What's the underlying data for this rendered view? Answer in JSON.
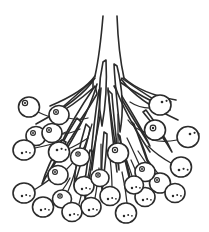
{
  "illustration": {
    "title": "Berry cluster line drawing",
    "subject": "infructescence",
    "style": "black-and-white ink line art",
    "caption": "Line drawing of a drooping berry cluster: a central stalk divides into spreading branchlets bearing many round berries, interspersed with narrow pointed bracts.",
    "background_color": "#ffffff",
    "ink_color": "#2b2b2b",
    "canvas": {
      "width": 209,
      "height": 232
    },
    "counts": {
      "berries": 31,
      "bracts": 16,
      "main_stalk_lines": 2
    },
    "parts": {
      "stalk_label": "main stalk",
      "branch_label": "branchlet",
      "berry_label": "berry",
      "pedicel_label": "pedicel",
      "bract_label": "bract"
    },
    "stalk": {
      "left_line": "M103,16 C101,40 99,58 95,76",
      "right_line": "M117,16 C118,42 120,60 124,78"
    },
    "branches": [
      "M95,76 C88,86 74,96 50,106",
      "M95,78 C86,92 66,108 36,124",
      "M97,84 C92,102 82,124 66,150",
      "M101,88 C99,112 96,140 92,170",
      "M108,88 C110,114 113,142 117,172",
      "M115,86 C122,106 134,128 150,152",
      "M122,80 C132,94 152,108 178,120",
      "M124,78 C135,88 154,96 176,100"
    ],
    "bracts": [
      {
        "d": "M93,80 C80,92 64,106 50,118 C62,112 80,100 93,88 Z"
      },
      {
        "d": "M95,86 C84,102 70,124 60,146 C72,132 88,110 97,94 Z"
      },
      {
        "d": "M99,90 C95,114 92,142 90,168 C95,144 101,114 103,96 Z"
      },
      {
        "d": "M108,90 C111,116 115,144 119,170 C117,142 113,112 112,94 Z"
      },
      {
        "d": "M114,86 C124,104 138,126 150,146 C140,124 124,100 117,88 Z"
      },
      {
        "d": "M120,82 C134,92 152,102 170,110 C152,98 132,86 122,78 Z"
      },
      {
        "d": "M103,62 C99,80 98,104 102,126 C106,104 107,80 106,60 Z"
      },
      {
        "d": "M117,66 C122,86 124,110 120,132 C118,110 115,86 114,64 Z"
      },
      {
        "d": "M77,118 C68,132 58,150 52,168 C62,152 74,134 81,122 Z"
      },
      {
        "d": "M86,124 C80,144 75,166 74,186 C80,166 88,142 90,128 Z"
      },
      {
        "d": "M132,122 C140,138 148,158 152,176 C146,156 138,136 134,124 Z"
      },
      {
        "d": "M143,112 C153,124 164,138 172,152 C164,134 152,118 146,110 Z"
      },
      {
        "d": "M62,140 C54,154 46,170 42,184 C50,170 60,152 66,142 Z"
      },
      {
        "d": "M118,134 C124,152 130,172 132,190 C128,172 122,150 120,136 Z"
      },
      {
        "d": "M104,132 C102,152 101,174 102,192 C104,174 107,152 107,134 Z"
      },
      {
        "d": "M90,150 C86,168 84,186 85,200 C88,186 92,166 93,152 Z"
      }
    ],
    "berries": [
      {
        "cx": 29,
        "cy": 107,
        "rx": 10.5,
        "ry": 10,
        "mark": "ring",
        "mx": 25,
        "my": 103,
        "mr": 2.6,
        "pedicel": "M38,112 C46,116 52,118 58,118"
      },
      {
        "cx": 36,
        "cy": 136,
        "rx": 10,
        "ry": 9.5,
        "mark": "ring",
        "mx": 33,
        "my": 133,
        "mr": 2.4,
        "pedicel": "M46,137 C54,137 60,135 66,132"
      },
      {
        "cx": 24,
        "cy": 150,
        "rx": 11,
        "ry": 10,
        "mark": "speck",
        "mx": 22,
        "my": 153,
        "mr": 2.2,
        "pedicel": "M35,148 C46,146 54,144 62,140"
      },
      {
        "cx": 52,
        "cy": 133,
        "rx": 10,
        "ry": 9.5,
        "mark": "ring",
        "mx": 49,
        "my": 130,
        "mr": 2.4,
        "pedicel": "M61,134 C68,134 74,132 80,129"
      },
      {
        "cx": 59,
        "cy": 152,
        "rx": 10.5,
        "ry": 10,
        "mark": "speck",
        "mx": 57,
        "my": 150,
        "mr": 2.4,
        "pedicel": "M68,149 C76,146 82,142 88,138"
      },
      {
        "cx": 58,
        "cy": 175,
        "rx": 10,
        "ry": 9.5,
        "mark": "ring",
        "mx": 55,
        "my": 172,
        "mr": 2.4,
        "pedicel": "M66,170 C74,162 80,154 85,146"
      },
      {
        "cx": 24,
        "cy": 193,
        "rx": 11,
        "ry": 10,
        "mark": "speck",
        "mx": 22,
        "my": 196,
        "mr": 2.2,
        "pedicel": "M34,190 C44,184 52,178 58,172"
      },
      {
        "cx": 43,
        "cy": 207,
        "rx": 10.5,
        "ry": 10,
        "mark": "speck",
        "mx": 41,
        "my": 210,
        "mr": 2.2,
        "pedicel": "M52,202 C60,194 66,186 70,178"
      },
      {
        "cx": 62,
        "cy": 199,
        "rx": 9.5,
        "ry": 9,
        "mark": "ring",
        "mx": 60,
        "my": 196,
        "mr": 2.2,
        "pedicel": "M68,191 C72,182 75,172 77,164"
      },
      {
        "cx": 72,
        "cy": 212,
        "rx": 10,
        "ry": 9.5,
        "mark": "speck",
        "mx": 70,
        "my": 215,
        "mr": 2.2,
        "pedicel": "M79,204 C82,194 84,184 85,176"
      },
      {
        "cx": 59,
        "cy": 115,
        "rx": 10,
        "ry": 9.5,
        "mark": "ring",
        "mx": 56,
        "my": 112,
        "mr": 2.4,
        "pedicel": "M68,118 C76,120 82,120 88,118"
      },
      {
        "cx": 57,
        "cy": 170,
        "rx": 0,
        "ry": 0,
        "mark": "none",
        "mx": 0,
        "my": 0,
        "mr": 0,
        "pedicel": ""
      },
      {
        "cx": 84,
        "cy": 186,
        "rx": 10,
        "ry": 9.5,
        "mark": "speck",
        "mx": 82,
        "my": 189,
        "mr": 2.2,
        "pedicel": "M88,177 C90,168 91,158 92,150"
      },
      {
        "cx": 91,
        "cy": 207,
        "rx": 10,
        "ry": 9.5,
        "mark": "speck",
        "mx": 89,
        "my": 210,
        "mr": 2.2,
        "pedicel": "M95,198 C97,188 98,178 99,168"
      },
      {
        "cx": 110,
        "cy": 196,
        "rx": 10,
        "ry": 9.5,
        "mark": "speck",
        "mx": 108,
        "my": 199,
        "mr": 2.2,
        "pedicel": "M112,187 C112,177 111,167 110,158"
      },
      {
        "cx": 126,
        "cy": 213,
        "rx": 10.5,
        "ry": 10,
        "mark": "speck",
        "mx": 124,
        "my": 216,
        "mr": 2.2,
        "pedicel": "M127,203 C126,192 124,181 122,172"
      },
      {
        "cx": 145,
        "cy": 197,
        "rx": 10,
        "ry": 9.5,
        "mark": "speck",
        "mx": 143,
        "my": 200,
        "mr": 2.2,
        "pedicel": "M142,188 C139,178 135,168 131,160"
      },
      {
        "cx": 160,
        "cy": 183,
        "rx": 10.5,
        "ry": 10,
        "mark": "ring",
        "mx": 157,
        "my": 180,
        "mr": 2.4,
        "pedicel": "M153,175 C148,166 143,158 138,151"
      },
      {
        "cx": 175,
        "cy": 193,
        "rx": 10,
        "ry": 9.5,
        "mark": "speck",
        "mx": 173,
        "my": 196,
        "mr": 2.2,
        "pedicel": "M167,185 C160,176 153,167 147,159"
      },
      {
        "cx": 145,
        "cy": 172,
        "rx": 10,
        "ry": 9.5,
        "mark": "ring",
        "mx": 142,
        "my": 169,
        "mr": 2.4,
        "pedicel": "M139,164 C135,155 131,146 127,138"
      },
      {
        "cx": 118,
        "cy": 153,
        "rx": 10.5,
        "ry": 10,
        "mark": "ring",
        "mx": 115,
        "my": 150,
        "mr": 2.6,
        "pedicel": "M118,142 C118,132 118,122 118,114"
      },
      {
        "cx": 80,
        "cy": 157,
        "rx": 9.5,
        "ry": 9,
        "mark": "ring",
        "mx": 78,
        "my": 154,
        "mr": 2.2,
        "pedicel": "M84,148 C87,140 90,132 92,124"
      },
      {
        "cx": 62,
        "cy": 123,
        "rx": 0,
        "ry": 0,
        "mark": "none",
        "mx": 0,
        "my": 0,
        "mr": 0,
        "pedicel": ""
      },
      {
        "cx": 160,
        "cy": 105,
        "rx": 11,
        "ry": 10,
        "mark": "speck",
        "mx": 162,
        "my": 102,
        "mr": 2.4,
        "pedicel": "M150,108 C142,108 136,106 130,102"
      },
      {
        "cx": 155,
        "cy": 130,
        "rx": 10.5,
        "ry": 10,
        "mark": "ring",
        "mx": 153,
        "my": 128,
        "mr": 2.8,
        "pedicel": "M145,132 C138,130 132,126 128,120"
      },
      {
        "cx": 188,
        "cy": 137,
        "rx": 11,
        "ry": 10.5,
        "mark": "speck",
        "mx": 190,
        "my": 134,
        "mr": 2.4,
        "pedicel": "M177,140 C168,142 160,142 152,140"
      },
      {
        "cx": 181,
        "cy": 167,
        "rx": 10.5,
        "ry": 10,
        "mark": "speck",
        "mx": 179,
        "my": 170,
        "mr": 2.4,
        "pedicel": "M171,163 C162,158 154,152 148,146"
      },
      {
        "cx": 172,
        "cy": 194,
        "rx": 0,
        "ry": 0,
        "mark": "none",
        "mx": 0,
        "my": 0,
        "mr": 0,
        "pedicel": ""
      },
      {
        "cx": 100,
        "cy": 178,
        "rx": 9,
        "ry": 8.5,
        "mark": "ring",
        "mx": 98,
        "my": 175,
        "mr": 2.2,
        "pedicel": "M101,170 C101,161 101,152 101,144"
      },
      {
        "cx": 42,
        "cy": 184,
        "rx": 0,
        "ry": 0,
        "mark": "none",
        "mx": 0,
        "my": 0,
        "mr": 0,
        "pedicel": ""
      },
      {
        "cx": 134,
        "cy": 185,
        "rx": 9.5,
        "ry": 9,
        "mark": "speck",
        "mx": 132,
        "my": 188,
        "mr": 2.2,
        "pedicel": "M132,176 C129,167 126,158 123,150"
      }
    ]
  }
}
